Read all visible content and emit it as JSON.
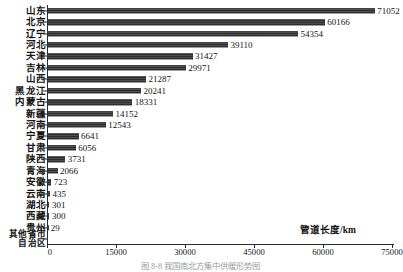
{
  "chart_data": {
    "type": "bar",
    "orientation": "horizontal",
    "title": "",
    "xlabel": "管道长度/km",
    "ylabel": "",
    "xlim": [
      0,
      75000
    ],
    "xticks": [
      0,
      15000,
      30000,
      45000,
      60000,
      75000
    ],
    "xtick_labels": [
      "0",
      "15000",
      "30000",
      "45000",
      "60000",
      "75000"
    ],
    "grid": false,
    "legend": null,
    "categories": [
      "山东",
      "北京",
      "辽宁",
      "河北",
      "天津",
      "吉林",
      "山西",
      "黑龙江",
      "内蒙古",
      "新疆",
      "河南",
      "宁夏",
      "甘肃",
      "陕西",
      "青海",
      "安徽",
      "云南",
      "湖北",
      "西藏",
      "贵州",
      "其他省市自治区"
    ],
    "values": [
      71052,
      60166,
      54354,
      39110,
      31427,
      29971,
      21287,
      20241,
      18331,
      14152,
      12543,
      6641,
      6056,
      3731,
      2066,
      723,
      435,
      301,
      300,
      29,
      0
    ],
    "value_labels": [
      "71052",
      "60166",
      "54354",
      "39110",
      "31427",
      "29971",
      "21287",
      "20241",
      "18331",
      "14152",
      "12543",
      "6641",
      "6056",
      "3731",
      "2066",
      "723",
      "435",
      "301",
      "300",
      "29",
      ""
    ],
    "bar_color": "#3a3a3a"
  },
  "caption": {
    "text": "图 8-8  我国南北方集中供暖形势图"
  }
}
